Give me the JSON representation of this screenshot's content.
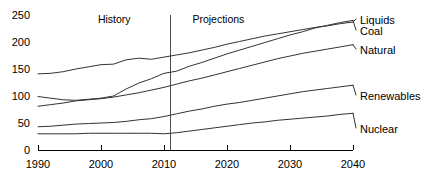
{
  "chart_data": {
    "type": "line",
    "title": "",
    "subtitle": "",
    "xlabel": "",
    "ylabel": "",
    "xlim": [
      1990,
      2040
    ],
    "ylim": [
      0,
      250
    ],
    "grid": false,
    "legend_position": "right-inline",
    "xticks": [
      1990,
      2000,
      2010,
      2020,
      2030,
      2040
    ],
    "xtick_labels": [
      "1990",
      "2000",
      "2010",
      "2020",
      "2030",
      "2040"
    ],
    "yticks": [
      0,
      50,
      100,
      150,
      200,
      250
    ],
    "ytick_labels": [
      "0",
      "50",
      "100",
      "150",
      "200",
      "250"
    ],
    "annotations": [
      {
        "text": "History",
        "x": 2003,
        "y": 242
      },
      {
        "text": "Projections",
        "x": 2018,
        "y": 242
      }
    ],
    "history_projection_split": 2011,
    "x": [
      1990,
      1992,
      1994,
      1996,
      1998,
      2000,
      2002,
      2004,
      2006,
      2008,
      2010,
      2012,
      2014,
      2016,
      2018,
      2020,
      2022,
      2024,
      2026,
      2028,
      2030,
      2032,
      2034,
      2036,
      2038,
      2040
    ],
    "series": [
      {
        "name": "Liquids",
        "label": "Liquids",
        "color": "#333333",
        "values": [
          141,
          142,
          145,
          150,
          154,
          158,
          159,
          167,
          170,
          168,
          172,
          176,
          180,
          185,
          190,
          196,
          201,
          206,
          211,
          215,
          219,
          223,
          227,
          230,
          234,
          237
        ]
      },
      {
        "name": "Coal",
        "label": "Coal",
        "color": "#333333",
        "values": [
          99,
          96,
          93,
          92,
          94,
          96,
          100,
          113,
          124,
          132,
          142,
          146,
          155,
          162,
          170,
          178,
          185,
          192,
          199,
          206,
          213,
          219,
          226,
          231,
          236,
          240
        ]
      },
      {
        "name": "Natural",
        "label": "Natural",
        "color": "#333333",
        "values": [
          81,
          84,
          87,
          91,
          93,
          95,
          98,
          102,
          106,
          111,
          116,
          122,
          128,
          133,
          139,
          145,
          151,
          157,
          163,
          169,
          174,
          179,
          183,
          187,
          191,
          195
        ]
      },
      {
        "name": "Renewables",
        "label": "Renewables",
        "color": "#333333",
        "values": [
          43,
          44,
          46,
          48,
          49,
          50,
          51,
          53,
          56,
          58,
          62,
          67,
          72,
          76,
          81,
          85,
          88,
          92,
          96,
          100,
          104,
          108,
          111,
          114,
          117,
          120
        ]
      },
      {
        "name": "Nuclear",
        "label": "Nuclear",
        "color": "#333333",
        "values": [
          30,
          30,
          30,
          30,
          31,
          31,
          31,
          31,
          31,
          31,
          30,
          32,
          35,
          38,
          41,
          44,
          47,
          50,
          52,
          55,
          57,
          59,
          61,
          63,
          66,
          68
        ]
      }
    ]
  }
}
